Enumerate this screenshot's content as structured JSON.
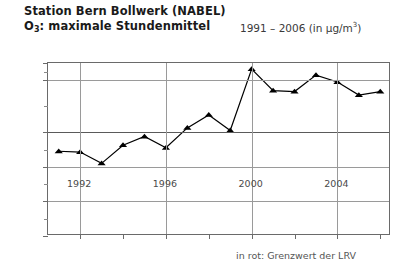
{
  "header": {
    "line1": "Station Bern Bollwerk (NABEL)",
    "line2_pre": "O",
    "line2_sub": "3",
    "line2_post": ": maximale Stundenmittel",
    "range_pre": "1991 – 2006 (in µg/m",
    "range_sup": "3",
    "range_post": ")"
  },
  "footnote": "in rot: Grenzwert der LRV",
  "colors": {
    "line": "#000000",
    "marker": "#000000",
    "grid": "#9a9a9a",
    "grid_major": "#5a5a5a",
    "frame": "#6a6a6a",
    "text": "#1a1a1a",
    "axis_text": "#4a4a4a"
  },
  "chart_data": {
    "type": "line",
    "subtitle": "1991 – 2006 (in µg/m3)",
    "xlabel": "",
    "ylabel": "",
    "x": [
      1991,
      1992,
      1993,
      1994,
      1995,
      1996,
      1997,
      1998,
      1999,
      2000,
      2001,
      2002,
      2003,
      2004,
      2005,
      2006
    ],
    "values": [
      98,
      97,
      84,
      105,
      115,
      102,
      125,
      140,
      122,
      193,
      168,
      167,
      186,
      178,
      163,
      167
    ],
    "series": [
      {
        "name": "O3 maximale Stundenmittel",
        "values": [
          98,
          97,
          84,
          105,
          115,
          102,
          125,
          140,
          122,
          193,
          168,
          167,
          186,
          178,
          163,
          167
        ]
      }
    ],
    "ylim": [
      0,
      200
    ],
    "xlim": [
      1990.5,
      2006.5
    ],
    "ytick_labels": [
      "200",
      "180",
      "120",
      "80",
      "40",
      "0"
    ],
    "ytick_values": [
      200,
      180,
      120,
      80,
      40,
      0
    ],
    "yminor_values": [
      190,
      150,
      100,
      60,
      20
    ],
    "xtick_labels": [
      "1992",
      "1996",
      "2000",
      "2004"
    ],
    "xtick_values": [
      1992,
      1996,
      2000,
      2004
    ],
    "grid": true,
    "legend": "none",
    "annotations": [
      "in rot: Grenzwert der LRV"
    ],
    "marker": "triangle",
    "limit_line_value": 120
  }
}
